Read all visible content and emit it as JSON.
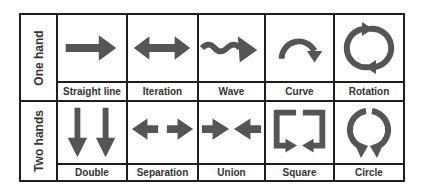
{
  "colors": {
    "icon": "#555555",
    "border": "#1e1e1e",
    "text": "#333333"
  },
  "rows": [
    {
      "label": "One hand",
      "gestures": [
        {
          "label": "Straight line",
          "icon": "right-arrow-icon"
        },
        {
          "label": "Iteration",
          "icon": "double-headed-arrow-icon"
        },
        {
          "label": "Wave",
          "icon": "wave-arrow-icon"
        },
        {
          "label": "Curve",
          "icon": "curved-arrow-icon"
        },
        {
          "label": "Rotation",
          "icon": "rotation-arrows-icon"
        }
      ]
    },
    {
      "label": "Two hands",
      "gestures": [
        {
          "label": "Double",
          "icon": "two-down-arrows-icon"
        },
        {
          "label": "Separation",
          "icon": "diverging-arrows-icon"
        },
        {
          "label": "Union",
          "icon": "converging-arrows-icon"
        },
        {
          "label": "Square",
          "icon": "square-arrows-icon"
        },
        {
          "label": "Circle",
          "icon": "circle-arrows-icon"
        }
      ]
    }
  ]
}
